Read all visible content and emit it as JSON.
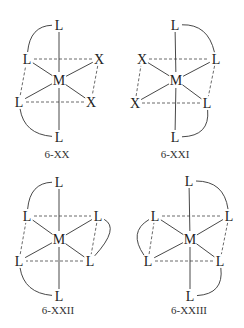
{
  "figure": {
    "colors": {
      "ink": "#222222",
      "background": "#ffffff"
    },
    "diagrams": [
      {
        "id": "6-XX",
        "label": "6-XX",
        "label_pos": [
          57,
          158
        ],
        "metal": {
          "symbol": "M",
          "pos": [
            59,
            80
          ]
        },
        "ligands": [
          {
            "symbol": "L",
            "pos": [
              59,
              25
            ]
          },
          {
            "symbol": "L",
            "pos": [
              27,
              59
            ]
          },
          {
            "symbol": "X",
            "pos": [
              99,
              59
            ]
          },
          {
            "symbol": "L",
            "pos": [
              19,
              102
            ]
          },
          {
            "symbol": "X",
            "pos": [
              91,
              102
            ]
          },
          {
            "symbol": "L",
            "pos": [
              59,
              137
            ]
          }
        ],
        "square_edges": [
          [
            1,
            2
          ],
          [
            2,
            4
          ],
          [
            4,
            3
          ],
          [
            3,
            1
          ]
        ],
        "chelate_arcs": [
          {
            "from": 0,
            "to": 1,
            "ctrl": [
              30,
              26
            ]
          },
          {
            "from": 3,
            "to": 5,
            "ctrl": [
              24,
              134
            ]
          }
        ]
      },
      {
        "id": "6-XXI",
        "label": "6-XXI",
        "label_pos": [
          175,
          158
        ],
        "metal": {
          "symbol": "M",
          "pos": [
            176,
            80
          ]
        },
        "ligands": [
          {
            "symbol": "L",
            "pos": [
              175,
              25
            ]
          },
          {
            "symbol": "X",
            "pos": [
              142,
              59
            ]
          },
          {
            "symbol": "L",
            "pos": [
              216,
              59
            ]
          },
          {
            "symbol": "X",
            "pos": [
              135,
              103
            ]
          },
          {
            "symbol": "L",
            "pos": [
              207,
              103
            ]
          },
          {
            "symbol": "L",
            "pos": [
              175,
              137
            ]
          }
        ],
        "square_edges": [
          [
            1,
            2
          ],
          [
            2,
            4
          ],
          [
            4,
            3
          ],
          [
            3,
            1
          ]
        ],
        "chelate_arcs": [
          {
            "from": 0,
            "to": 2,
            "ctrl": [
              208,
              24
            ]
          },
          {
            "from": 4,
            "to": 5,
            "ctrl": [
              210,
              136
            ]
          }
        ]
      },
      {
        "id": "6-XXII",
        "label": "6-XXII",
        "label_pos": [
          58,
          314
        ],
        "metal": {
          "symbol": "M",
          "pos": [
            59,
            239
          ]
        },
        "ligands": [
          {
            "symbol": "L",
            "pos": [
              59,
              182
            ]
          },
          {
            "symbol": "L",
            "pos": [
              27,
              216
            ]
          },
          {
            "symbol": "L",
            "pos": [
              98,
              216
            ]
          },
          {
            "symbol": "L",
            "pos": [
              19,
              261
            ]
          },
          {
            "symbol": "L",
            "pos": [
              90,
              261
            ]
          },
          {
            "symbol": "L",
            "pos": [
              59,
              296
            ]
          }
        ],
        "square_edges": [
          [
            1,
            2
          ],
          [
            2,
            4
          ],
          [
            4,
            3
          ],
          [
            3,
            1
          ]
        ],
        "chelate_arcs": [
          {
            "from": 0,
            "to": 1,
            "ctrl": [
              30,
              183
            ]
          },
          {
            "from": 2,
            "to": 4,
            "ctrl": [
              120,
              228
            ]
          },
          {
            "from": 3,
            "to": 5,
            "ctrl": [
              24,
              293
            ]
          }
        ]
      },
      {
        "id": "6-XXIII",
        "label": "6-XXIII",
        "label_pos": [
          189,
          314
        ],
        "metal": {
          "symbol": "M",
          "pos": [
            190,
            239
          ]
        },
        "ligands": [
          {
            "symbol": "L",
            "pos": [
              189,
              181
            ]
          },
          {
            "symbol": "L",
            "pos": [
              155,
              216
            ]
          },
          {
            "symbol": "L",
            "pos": [
              229,
              216
            ]
          },
          {
            "symbol": "L",
            "pos": [
              148,
              261
            ]
          },
          {
            "symbol": "L",
            "pos": [
              220,
              261
            ]
          },
          {
            "symbol": "L",
            "pos": [
              190,
              296
            ]
          }
        ],
        "square_edges": [
          [
            1,
            2
          ],
          [
            2,
            4
          ],
          [
            4,
            3
          ],
          [
            3,
            1
          ]
        ],
        "chelate_arcs": [
          {
            "from": 0,
            "to": 2,
            "ctrl": [
              224,
              181
            ]
          },
          {
            "from": 1,
            "to": 3,
            "ctrl": [
              128,
              232
            ]
          },
          {
            "from": 4,
            "to": 5,
            "ctrl": [
              224,
              294
            ]
          }
        ]
      }
    ]
  }
}
